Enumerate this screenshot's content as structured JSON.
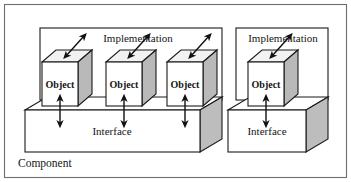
{
  "diagram": {
    "title": "Component",
    "frame_label": "Component",
    "border_color": "#6e6e6e",
    "line_color": "#1b1b1b",
    "cube_top_color": "#f2f2f2",
    "cube_side_color": "#b9b9b9",
    "slab_side_color": "#bdbdbd",
    "background_color": "#ffffff",
    "groups": [
      {
        "id": "left-group",
        "implementation_label": "Implementation",
        "interface_label": "Interface",
        "object_count": 3,
        "objects": [
          {
            "label": "Object"
          },
          {
            "label": "Object"
          },
          {
            "label": "Object"
          }
        ]
      },
      {
        "id": "right-group",
        "implementation_label": "Implementation",
        "interface_label": "Interface",
        "object_count": 1,
        "objects": [
          {
            "label": "Object"
          }
        ]
      }
    ],
    "connectors": {
      "object_to_interface": "double-headed-vertical-arrow",
      "object_to_implementation": "double-headed-diagonal-arrow"
    }
  }
}
